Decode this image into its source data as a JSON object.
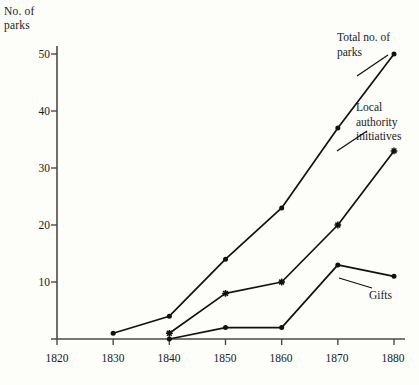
{
  "chart_data": {
    "type": "line",
    "title": "",
    "xlabel": "",
    "ylabel": "No. of parks",
    "x": [
      1820,
      1830,
      1840,
      1850,
      1860,
      1870,
      1880
    ],
    "xlim": [
      1820,
      1880
    ],
    "ylim": [
      0,
      52
    ],
    "xticks": [
      "1820",
      "1830",
      "1840",
      "1850",
      "1860",
      "1870",
      "1880"
    ],
    "yticks": [
      "10",
      "20",
      "30",
      "40",
      "50"
    ],
    "ytick_values": [
      10,
      20,
      30,
      40,
      50
    ],
    "grid": false,
    "legend_position": "inline-right",
    "series": [
      {
        "name": "Total no. of parks",
        "marker": "filled-circle",
        "x": [
          1830,
          1840,
          1850,
          1860,
          1870,
          1880
        ],
        "values": [
          1,
          4,
          14,
          23,
          37,
          50
        ]
      },
      {
        "name": "Local authority initiatives",
        "marker": "star",
        "x": [
          1840,
          1850,
          1860,
          1870,
          1880
        ],
        "values": [
          1,
          8,
          10,
          20,
          33
        ]
      },
      {
        "name": "Gifts",
        "marker": "filled-circle",
        "x": [
          1840,
          1850,
          1860,
          1870,
          1880
        ],
        "values": [
          0,
          2,
          2,
          13,
          11
        ]
      }
    ]
  },
  "axes": {
    "y_title": "No. of\nparks",
    "ytick_labels": [
      "50",
      "40",
      "30",
      "20",
      "10"
    ],
    "xtick_labels": [
      "1820",
      "1830",
      "1840",
      "1850",
      "1860",
      "1870",
      "1880"
    ]
  },
  "series_labels": {
    "total": "Total no. of\nparks",
    "local": "Local\nauthority\ninitiatives",
    "gifts": "Gifts"
  },
  "colors": {
    "line": "#111111",
    "axis": "#4a4a4a",
    "background": "#fdfdf9",
    "text": "#1a1a1a"
  }
}
